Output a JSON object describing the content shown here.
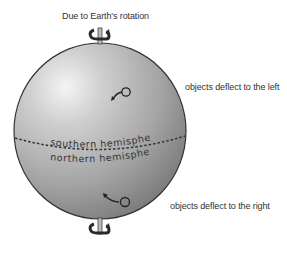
{
  "title": "Due to Earth's rotation",
  "annotations": {
    "upper": "objects deflect to the left",
    "lower": "objects deflect to the right"
  },
  "globe": {
    "upper_hemisphere_label": "southern hemisphere",
    "lower_hemisphere_label": "northern hemisphere",
    "equator_style": "dashed"
  },
  "icons": {
    "top_axis": "rotation-axis-icon",
    "bottom_axis": "rotation-axis-icon",
    "upper_deflection": "deflection-arrow-left-icon",
    "lower_deflection": "deflection-arrow-right-icon"
  },
  "colors": {
    "globe_light": "#e6e6e6",
    "globe_mid": "#a8a8a8",
    "globe_dark": "#6e6e6e",
    "outline": "#333333",
    "text": "#333333"
  }
}
